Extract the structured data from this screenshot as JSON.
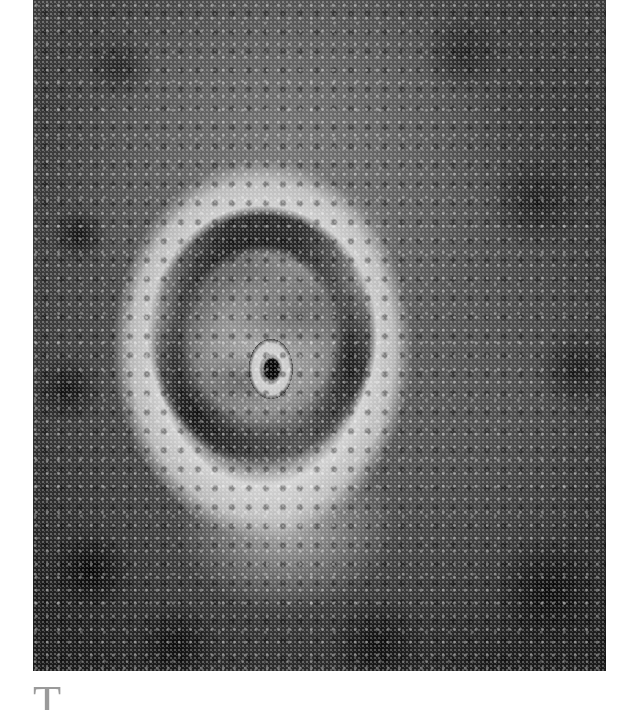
{
  "figure": {
    "colors": {
      "background_dark": "#1c1c1c",
      "haze_gray": "#787878",
      "band_light": "#d7d7d7",
      "eye_black": "#050505"
    }
  },
  "text": {
    "paragraph_start": "T"
  }
}
